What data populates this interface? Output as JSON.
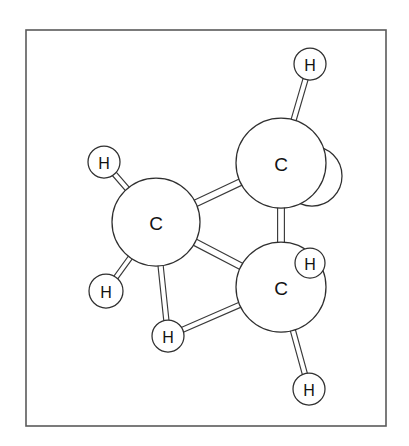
{
  "figure": {
    "kind": "molecular-ball-and-stick-model",
    "background_color": "#ffffff",
    "frame": {
      "x": 26,
      "y": 30,
      "width": 360,
      "height": 396,
      "stroke_color": "#5a5a5a"
    },
    "style": {
      "atom_fill": "#ffffff",
      "atom_stroke": "#2f2f2f",
      "bond_fill": "#ffffff",
      "bond_stroke": "#3a3a3a",
      "label_color": "#121212"
    }
  },
  "atoms": [
    {
      "id": "C1",
      "element": "C",
      "label": "C",
      "cx": 156,
      "cy": 222,
      "r": 44,
      "kind": "carbon"
    },
    {
      "id": "C2",
      "element": "C",
      "label": "C",
      "cx": 281,
      "cy": 163,
      "r": 45,
      "kind": "carbon"
    },
    {
      "id": "C3",
      "element": "C",
      "label": "C",
      "cx": 281,
      "cy": 287,
      "r": 45,
      "kind": "carbon"
    },
    {
      "id": "H1",
      "element": "H",
      "label": "H",
      "cx": 310,
      "cy": 64,
      "r": 16,
      "kind": "hydrogen"
    },
    {
      "id": "H2",
      "element": "H",
      "label": "H",
      "cx": 104,
      "cy": 162,
      "r": 16,
      "kind": "hydrogen"
    },
    {
      "id": "H3",
      "element": "H",
      "label": "H",
      "cx": 106,
      "cy": 291,
      "r": 17,
      "kind": "hydrogen"
    },
    {
      "id": "H4",
      "element": "H",
      "label": "H",
      "cx": 310,
      "cy": 263,
      "r": 15,
      "kind": "hydrogen"
    },
    {
      "id": "H5",
      "element": "H",
      "label": "H",
      "cx": 168,
      "cy": 336,
      "r": 16,
      "kind": "hydrogen"
    },
    {
      "id": "H6",
      "element": "H",
      "label": "H",
      "cx": 309,
      "cy": 389,
      "r": 16,
      "kind": "hydrogen"
    }
  ],
  "occluded_atoms": [
    {
      "id": "H7",
      "element": "H",
      "label": "",
      "cx": 312,
      "cy": 176,
      "r": 30,
      "kind": "hydrogen-hidden",
      "note": "arc sliver visible behind C2"
    }
  ],
  "bonds": [
    {
      "id": "b1",
      "from": "C2",
      "to": "H1",
      "half_width": 2.6
    },
    {
      "id": "b2",
      "from": "C1",
      "to": "H2",
      "half_width": 2.6
    },
    {
      "id": "b3",
      "from": "C1",
      "to": "H3",
      "half_width": 2.4
    },
    {
      "id": "b4",
      "from": "C1",
      "to": "C2",
      "half_width": 3.4
    },
    {
      "id": "b5",
      "from": "C1",
      "to": "C3",
      "half_width": 3.4
    },
    {
      "id": "b6",
      "from": "C2",
      "to": "C3",
      "half_width": 3.4
    },
    {
      "id": "b7",
      "from": "C3",
      "to": "H4",
      "half_width": 2.4
    },
    {
      "id": "b8",
      "from": "C1",
      "to": "H5",
      "half_width": 2.6
    },
    {
      "id": "b9",
      "from": "C3",
      "to": "H5",
      "half_width": 2.6
    },
    {
      "id": "b10",
      "from": "C3",
      "to": "H6",
      "half_width": 2.6
    }
  ],
  "formula": {
    "carbon_count": 3,
    "hydrogen_count": 6,
    "displayed_labels": [
      "C",
      "C",
      "C",
      "H",
      "H",
      "H",
      "H",
      "H",
      "H"
    ]
  }
}
